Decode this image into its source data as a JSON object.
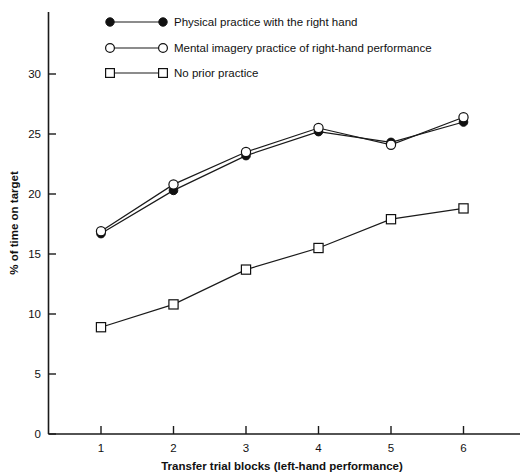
{
  "chart_data": {
    "type": "line",
    "title": "",
    "xlabel": "Transfer trial blocks (left-hand performance)",
    "ylabel": "% of time on target",
    "x": [
      1,
      2,
      3,
      4,
      5,
      6
    ],
    "categories": [
      "1",
      "2",
      "3",
      "4",
      "5",
      "6"
    ],
    "xlim": [
      0.55,
      6.45
    ],
    "ylim": [
      0,
      33.5
    ],
    "yticks": [
      0,
      5,
      10,
      15,
      20,
      25,
      30
    ],
    "ytick_labels": [
      "0",
      "5",
      "10",
      "15",
      "20",
      "25",
      "30"
    ],
    "xticks": [
      1,
      2,
      3,
      4,
      5,
      6
    ],
    "xtick_labels": [
      "1",
      "2",
      "3",
      "4",
      "5",
      "6"
    ],
    "grid": false,
    "legend_position": "top-left-inside",
    "series": [
      {
        "name": "Physical practice with the right hand",
        "marker": "filled-circle",
        "values": [
          16.7,
          20.3,
          23.2,
          25.2,
          24.3,
          26.0
        ]
      },
      {
        "name": "Mental imagery practice of right-hand performance",
        "marker": "open-circle",
        "values": [
          16.9,
          20.8,
          23.5,
          25.5,
          24.1,
          26.4
        ]
      },
      {
        "name": "No prior practice",
        "marker": "open-square",
        "values": [
          8.9,
          10.8,
          13.7,
          15.5,
          17.9,
          18.8
        ]
      }
    ]
  },
  "legend": {
    "items": [
      {
        "label": "Physical practice with the right hand",
        "marker": "filled-circle"
      },
      {
        "label": "Mental imagery practice of right-hand performance",
        "marker": "open-circle"
      },
      {
        "label": "No prior practice",
        "marker": "open-square"
      }
    ]
  },
  "axes": {
    "y_title": "% of time on target",
    "x_title": "Transfer trial blocks (left-hand performance)"
  },
  "colors": {
    "ink": "#111111",
    "background": "#ffffff"
  }
}
